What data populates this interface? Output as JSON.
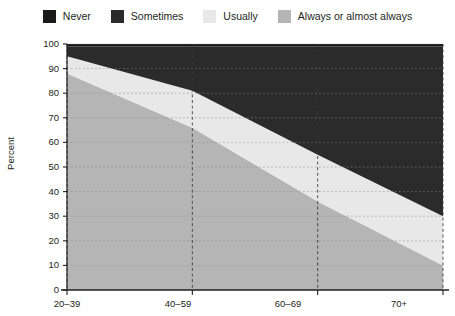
{
  "legend": {
    "position": "top",
    "items": [
      {
        "label": "Never",
        "color": "#1a1a1a",
        "icon": "legend-swatch-icon"
      },
      {
        "label": "Sometimes",
        "color": "#2b2b2b",
        "icon": "legend-swatch-icon"
      },
      {
        "label": "Usually",
        "color": "#e8e8e8",
        "icon": "legend-swatch-icon"
      },
      {
        "label": "Always or almost always",
        "color": "#b5b5b5",
        "icon": "legend-swatch-icon"
      }
    ]
  },
  "chart_data": {
    "type": "area",
    "stacked": true,
    "title": "",
    "xlabel": "",
    "ylabel": "Percent",
    "categories": [
      "20–39",
      "40–59",
      "60–69",
      "70+"
    ],
    "x": [
      "20-39",
      "40-59",
      "60-69",
      "70+"
    ],
    "ylim": [
      0,
      100
    ],
    "yticks": [
      0,
      10,
      20,
      30,
      40,
      50,
      60,
      70,
      80,
      90,
      100
    ],
    "ytick_labels": [
      "0",
      "10",
      "20",
      "30",
      "40",
      "50",
      "60",
      "70",
      "80",
      "90",
      "100"
    ],
    "xtick_labels": [
      "20–39",
      "40–59",
      "60–69",
      "70+"
    ],
    "grid": true,
    "grid_style": "dotted",
    "series": [
      {
        "name": "Always or almost always",
        "color": "#b5b5b5",
        "values": [
          88,
          66,
          36,
          10
        ]
      },
      {
        "name": "Usually",
        "color": "#e8e8e8",
        "values": [
          7,
          15,
          19,
          20
        ]
      },
      {
        "name": "Sometimes",
        "color": "#2b2b2b",
        "values": [
          4,
          18,
          44,
          69
        ]
      },
      {
        "name": "Never",
        "color": "#1a1a1a",
        "values": [
          1,
          1,
          1,
          1
        ]
      }
    ],
    "cumulative_tops": {
      "Always or almost always": [
        88,
        66,
        36,
        10
      ],
      "Usually": [
        95,
        81,
        55,
        30
      ],
      "Sometimes": [
        99,
        99,
        99,
        99
      ],
      "Never": [
        100,
        100,
        100,
        100
      ]
    }
  },
  "axes": {
    "y_axis_title": "Percent",
    "y_min": "0",
    "y_max": "100"
  }
}
